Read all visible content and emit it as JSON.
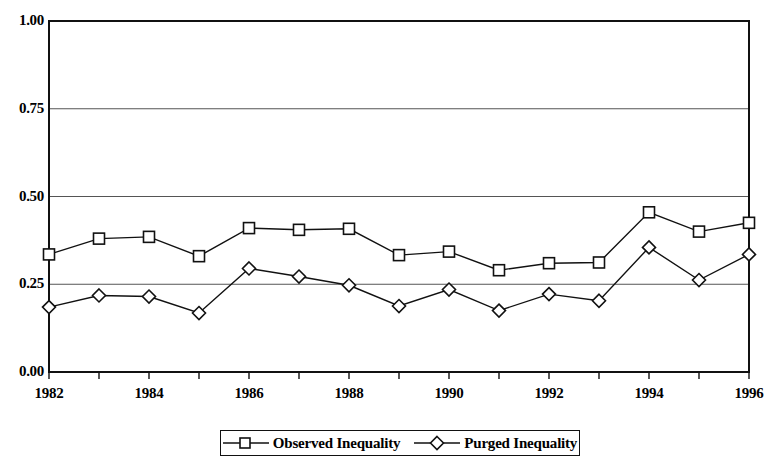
{
  "chart_data": {
    "type": "line",
    "title": "",
    "xlabel": "",
    "ylabel": "",
    "x": [
      1982,
      1983,
      1984,
      1985,
      1986,
      1987,
      1988,
      1989,
      1990,
      1991,
      1992,
      1993,
      1994,
      1995,
      1996
    ],
    "xlim": [
      1982,
      1996
    ],
    "ylim": [
      0.0,
      1.0
    ],
    "ytick_labels": [
      "1.00",
      "0.75",
      "0.50",
      "0.25",
      "0.00"
    ],
    "ytick_values": [
      1.0,
      0.75,
      0.5,
      0.25,
      0.0
    ],
    "xtick_labels": [
      "1982",
      "1984",
      "1986",
      "1988",
      "1990",
      "1992",
      "1994",
      "1996"
    ],
    "xtick_values": [
      1982,
      1984,
      1986,
      1988,
      1990,
      1992,
      1994,
      1996
    ],
    "minor_xticks": [
      1983,
      1985,
      1987,
      1989,
      1991,
      1993,
      1995
    ],
    "grid": "horizontal",
    "legend_position": "bottom-center",
    "series": [
      {
        "name": "Observed Inequality",
        "marker": "square",
        "color": "#111111",
        "values": [
          0.335,
          0.38,
          0.385,
          0.33,
          0.41,
          0.405,
          0.408,
          0.333,
          0.343,
          0.29,
          0.31,
          0.312,
          0.455,
          0.4,
          0.425
        ]
      },
      {
        "name": "Purged Inequality",
        "marker": "diamond",
        "color": "#111111",
        "values": [
          0.185,
          0.218,
          0.215,
          0.168,
          0.295,
          0.272,
          0.247,
          0.188,
          0.235,
          0.175,
          0.222,
          0.203,
          0.355,
          0.262,
          0.335
        ]
      }
    ]
  },
  "legend": {
    "items": [
      {
        "label": "Observed Inequality",
        "marker": "square"
      },
      {
        "label": "Purged Inequality",
        "marker": "diamond"
      }
    ]
  }
}
